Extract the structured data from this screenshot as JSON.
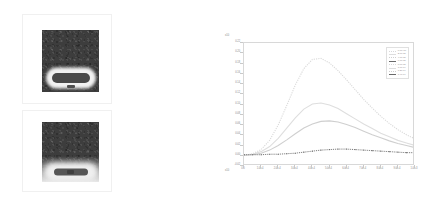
{
  "figure": {
    "panels": [
      {
        "name": "top-image-panel",
        "caption": "",
        "description": "dark speckled field with bright stadium-shaped feature at bottom"
      },
      {
        "name": "bottom-image-panel",
        "caption": "",
        "description": "dark speckled field fading to bright at bottom with rounded feature"
      }
    ]
  },
  "chart_data": {
    "type": "line",
    "title": "",
    "xlabel": "",
    "ylabel": "",
    "grid": false,
    "legend_position": "upper right",
    "x_exponent": "x10",
    "y_exponent": "x10",
    "xlim": [
      0,
      1.0
    ],
    "ylim": [
      -0.02,
      0.22
    ],
    "xticks": [
      "0.0",
      "1.0e-4",
      "2.0e-4",
      "3.0e-4",
      "4.0e-4",
      "5.0e-4",
      "6.0e-4",
      "7.0e-4",
      "8.0e-4",
      "9.0e-4",
      "1.0e-3"
    ],
    "yticks": [
      "-0.02",
      "0.00",
      "0.02",
      "0.04",
      "0.06",
      "0.08",
      "0.10",
      "0.12",
      "0.14",
      "0.16",
      "0.18",
      "0.20",
      "0.22"
    ],
    "x": [
      0.0,
      0.05,
      0.1,
      0.15,
      0.2,
      0.25,
      0.3,
      0.35,
      0.4,
      0.45,
      0.5,
      0.55,
      0.6,
      0.65,
      0.7,
      0.75,
      0.8,
      0.85,
      0.9,
      0.95,
      1.0
    ],
    "series": [
      {
        "name": "curve-1",
        "label": "0.0e+00",
        "color": "#d9d9d9",
        "style": "dotted",
        "values": [
          0.001,
          0.004,
          0.012,
          0.03,
          0.06,
          0.098,
          0.138,
          0.17,
          0.188,
          0.19,
          0.181,
          0.166,
          0.148,
          0.129,
          0.11,
          0.093,
          0.077,
          0.063,
          0.051,
          0.041,
          0.033
        ]
      },
      {
        "name": "curve-2",
        "label": "2.0e-05",
        "color": "#dedede",
        "style": "solid",
        "values": [
          0.001,
          0.003,
          0.008,
          0.018,
          0.034,
          0.054,
          0.074,
          0.091,
          0.101,
          0.103,
          0.099,
          0.092,
          0.082,
          0.072,
          0.062,
          0.053,
          0.044,
          0.037,
          0.03,
          0.025,
          0.02
        ]
      },
      {
        "name": "curve-3",
        "label": "4.0e-05",
        "color": "#cfcfcf",
        "style": "solid",
        "values": [
          0.001,
          0.002,
          0.005,
          0.011,
          0.02,
          0.031,
          0.043,
          0.054,
          0.062,
          0.067,
          0.068,
          0.066,
          0.061,
          0.055,
          0.048,
          0.041,
          0.035,
          0.029,
          0.024,
          0.02,
          0.016
        ]
      },
      {
        "name": "curve-4",
        "label": "6.0e-05",
        "color": "#6a6a6a",
        "style": "dotted-markers",
        "values": [
          0.002,
          0.002,
          0.002,
          0.003,
          0.003,
          0.004,
          0.005,
          0.007,
          0.009,
          0.011,
          0.012,
          0.013,
          0.013,
          0.012,
          0.011,
          0.01,
          0.009,
          0.008,
          0.007,
          0.006,
          0.006
        ]
      }
    ],
    "legend_entries": [
      "0.0e+00",
      "2.0e-05",
      "4.0e-05",
      "6.0e-05",
      "8.0e-05",
      "1.0e-04",
      "1.2e-04",
      "1.4e-04"
    ]
  }
}
